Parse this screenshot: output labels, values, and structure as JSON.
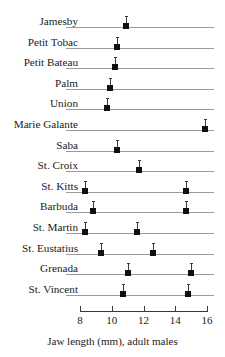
{
  "chart_data": {
    "type": "scatter",
    "title": "",
    "xlabel": "Jaw length (mm), adult males",
    "ylabel": "",
    "xlim": [
      8,
      16
    ],
    "xticks": [
      8,
      10,
      12,
      14,
      16
    ],
    "xtick_labels": [
      "8",
      "10",
      "12",
      "14",
      "16"
    ],
    "grid": false,
    "legend": "none",
    "orientation": "horizontal",
    "marker": "filled-square-with-upper-whisker",
    "categories": [
      "Jamesby",
      "Petit Tobac",
      "Petit Bateau",
      "Palm",
      "Union",
      "Marie Galante",
      "Saba",
      "St. Croix",
      "St. Kitts",
      "Barbuda",
      "St. Martin",
      "St. Eustatius",
      "Grenada",
      "St. Vincent"
    ],
    "rows": [
      {
        "label": "Jamesby",
        "values": [
          10.9
        ]
      },
      {
        "label": "Petit Tobac",
        "values": [
          10.3
        ]
      },
      {
        "label": "Petit Bateau",
        "values": [
          10.2
        ]
      },
      {
        "label": "Palm",
        "values": [
          9.9
        ]
      },
      {
        "label": "Union",
        "values": [
          9.7
        ]
      },
      {
        "label": "Marie Galante",
        "values": [
          15.9
        ]
      },
      {
        "label": "Saba",
        "values": [
          10.3
        ]
      },
      {
        "label": "St. Croix",
        "values": [
          11.7
        ]
      },
      {
        "label": "St. Kitts",
        "values": [
          8.3,
          14.7
        ]
      },
      {
        "label": "Barbuda",
        "values": [
          8.8,
          14.7
        ]
      },
      {
        "label": "St. Martin",
        "values": [
          8.3,
          11.6
        ]
      },
      {
        "label": "St. Eustatius",
        "values": [
          9.3,
          12.6
        ]
      },
      {
        "label": "Grenada",
        "values": [
          11.0,
          15.0
        ]
      },
      {
        "label": "St. Vincent",
        "values": [
          10.7,
          14.8
        ]
      }
    ]
  },
  "colors": {
    "marker": "#101010",
    "row_line": "#9a9a9a",
    "axis": "#3a3a3a",
    "text": "#1a1a1a",
    "background": "#ffffff"
  }
}
